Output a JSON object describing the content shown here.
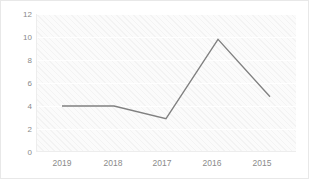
{
  "chart_data": {
    "type": "line",
    "title": "",
    "subtitle": "",
    "xlabel": "",
    "ylabel": "",
    "categories": [
      "2019",
      "2018",
      "2017",
      "2016",
      "2015"
    ],
    "values": [
      4.0,
      4.0,
      2.9,
      9.8,
      4.8
    ],
    "series": [
      {
        "name": "",
        "values": [
          4.0,
          4.0,
          2.9,
          9.8,
          4.8
        ],
        "color": "#808080"
      }
    ],
    "ylim": [
      0,
      12
    ],
    "yticks": [
      0,
      2,
      4,
      6,
      8,
      10,
      12
    ],
    "ytick_labels": [
      "0",
      "2",
      "4",
      "6",
      "8",
      "10",
      "12"
    ],
    "xtick_labels": [
      "2019",
      "2018",
      "2017",
      "2016",
      "2015"
    ],
    "grid": true,
    "grid_axis": "y",
    "legend": false,
    "legend_position": "none",
    "markers": false,
    "line_color": "#808080",
    "plot_background": "#fbfbfb",
    "axis_label_color": "#8a8a8a"
  }
}
